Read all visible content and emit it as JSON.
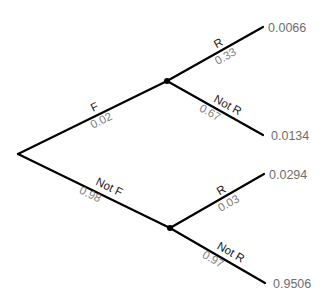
{
  "diagram": {
    "type": "probability-tree",
    "root": {
      "x": 18,
      "y": 154
    },
    "nodes": {
      "f": {
        "x": 167,
        "y": 81
      },
      "not_f": {
        "x": 170,
        "y": 228
      }
    },
    "first_level": {
      "f": {
        "event": "F",
        "prob": "0.02"
      },
      "not_f": {
        "event": "Not F",
        "prob": "0.98"
      }
    },
    "second_level": {
      "f_r": {
        "event": "R",
        "prob": "0.33",
        "joint": "0.0066"
      },
      "f_not_r": {
        "event": "Not R",
        "prob": "0.67",
        "joint": "0.0134"
      },
      "not_f_r": {
        "event": "R",
        "prob": "0.03",
        "joint": "0.0294"
      },
      "not_f_not_r": {
        "event": "Not R",
        "prob": "0.97",
        "joint": "0.9506"
      }
    },
    "colors": {
      "line": "#000000",
      "event_label": "#1a1a1a",
      "prob_label": "#808080",
      "leaf_label": "#6e6e6e"
    }
  }
}
